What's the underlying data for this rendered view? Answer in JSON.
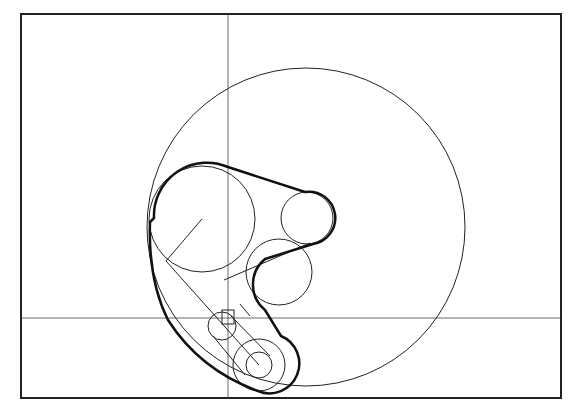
{
  "diagram": {
    "title": "",
    "colors": {
      "stroke": "#222222",
      "background": "#ffffff"
    },
    "frame": {
      "x": 21,
      "y": 14,
      "w": 540,
      "h": 384
    },
    "crosshair": {
      "vx": 228,
      "hy": 318
    },
    "large_circle": {
      "cx": 306,
      "cy": 227,
      "r": 159
    },
    "pulleys": [
      {
        "name": "large-pulley",
        "cx": 202,
        "cy": 219,
        "r": 53
      },
      {
        "name": "upper-right-pulley",
        "cx": 307,
        "cy": 218,
        "r": 26
      },
      {
        "name": "idler-pulley",
        "cx": 279,
        "cy": 272,
        "r": 33
      },
      {
        "name": "small-upper-pulley",
        "cx": 222,
        "cy": 326,
        "r": 14
      },
      {
        "name": "lower-pulley",
        "cx": 259,
        "cy": 365,
        "r": 26
      },
      {
        "name": "lower-pulley-inner",
        "cx": 259,
        "cy": 365,
        "r": 13
      }
    ]
  }
}
